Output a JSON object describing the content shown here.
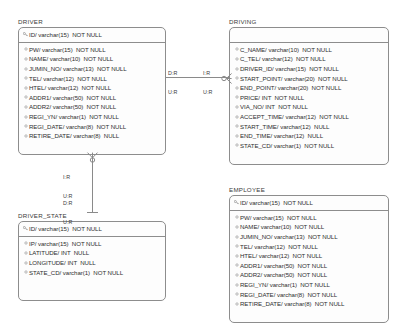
{
  "diagram": {
    "type": "entity-relationship-diagram",
    "background": "#ffffff",
    "line_color": "#8a8a8a",
    "border_color": "#8d8d8d"
  },
  "entities": [
    {
      "name": "DRIVER",
      "primary_keys": [
        "ID/ varchar(15)  NOT NULL"
      ],
      "attributes": [
        "PW/ varchar(15)  NOT NULL",
        "NAME/ varchar(10)  NOT NULL",
        "JUMIN_NO/ varchar(13)  NOT NULL",
        "TEL/ varchar(12)  NOT NULL",
        "HTEL/ varchar(12)  NOT NULL",
        "ADDR1/ varchar(50)  NOT NULL",
        "ADDR2/ varchar(50)  NOT NULL",
        "REGI_YN/ varchar(1)  NOT NULL",
        "REGI_DATE/ varchar(8)  NOT NULL",
        "RETIRE_DATE/ varchar(8)  NULL"
      ]
    },
    {
      "name": "DRIVING",
      "primary_keys": [],
      "attributes": [
        "C_NAME/ varchar(10)  NOT NULL",
        "C_TEL/ varchar(12)  NOT NULL",
        "DRIVER_ID/ varchar(15)  NOT NULL",
        "START_POINT/ varchar(20)  NOT NULL",
        "END_POINT/ varchar(20)  NOT NULL",
        "PRICE/ INT  NOT NULL",
        "VIA_NO/ INT  NOT NULL",
        "ACCEPT_TIME/ varchar(12)  NOT NULL",
        "START_TIME/ varchar(12)  NULL",
        "END_TIME/ varchar(12)  NULL",
        "STATE_CD/ varchar(1)  NOT NULL"
      ]
    },
    {
      "name": "DRIVER_STATE",
      "primary_keys": [
        "ID/ varchar(15)  NOT NULL"
      ],
      "attributes": [
        "IP/ varchar(15)  NOT NULL",
        "LATITUDE/ INT  NULL",
        "LONGITUDE/ INT  NULL",
        "STATE_CD/ varchar(1)  NOT NULL"
      ]
    },
    {
      "name": "EMPLOYEE",
      "primary_keys": [
        "ID/ varchar(15)  NOT NULL"
      ],
      "attributes": [
        "PW/ varchar(15)  NOT NULL",
        "NAME/ varchar(10)  NOT NULL",
        "JUMIN_NO/ varchar(13)  NOT NULL",
        "TEL/ varchar(12)  NOT NULL",
        "HTEL/ varchar(12)  NOT NULL",
        "ADDR1/ varchar(50)  NOT NULL",
        "ADDR2/ varchar(50)  NOT NULL",
        "REGI_YN/ varchar(1)  NOT NULL",
        "REGI_DATE/ varchar(8)  NOT NULL",
        "RETIRE_DATE/ varchar(8)  NOT NULL"
      ]
    }
  ],
  "relationships": [
    {
      "id": "driver-driving",
      "from": "DRIVER",
      "to": "DRIVING",
      "source_label": "D:R\nU:R",
      "target_label": "I:R\nU:R"
    },
    {
      "id": "driver-driverstate",
      "from": "DRIVER",
      "to": "DRIVER_STATE",
      "source_label": "I:R\nU:R",
      "target_label": "D:R\nU:R"
    }
  ],
  "icons": {
    "primary_key": "key-icon",
    "attribute": "circle-icon"
  }
}
